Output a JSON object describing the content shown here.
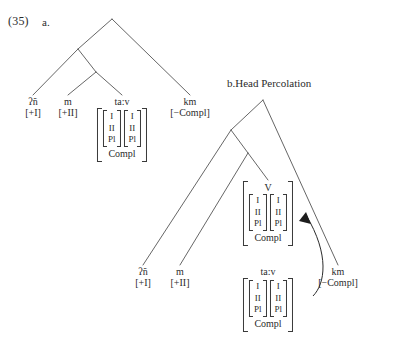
{
  "example": {
    "number": "(35)",
    "part_a": "a.",
    "part_b_label": "b.Head Percolation"
  },
  "features": {
    "person1": "I",
    "person2": "II",
    "plural": "Pl",
    "compl": "Compl",
    "verb_head": "V"
  },
  "tree_a": {
    "leaves": [
      {
        "form": "ʔñ",
        "feature": "[+I]"
      },
      {
        "form": "m",
        "feature": "[+II]"
      },
      {
        "form": "ta:v",
        "feature": ""
      },
      {
        "form": "km",
        "feature": "[−Compl]"
      }
    ]
  },
  "tree_b": {
    "leaves": [
      {
        "form": "ʔñ",
        "feature": "[+I]"
      },
      {
        "form": "m",
        "feature": "[+II]"
      },
      {
        "form": "ta:v",
        "feature": ""
      },
      {
        "form": "km",
        "feature": "[−Compl]"
      }
    ]
  },
  "colors": {
    "ink": "#2b2b2b",
    "line": "#555555",
    "bracket": "#3a3a3a"
  }
}
